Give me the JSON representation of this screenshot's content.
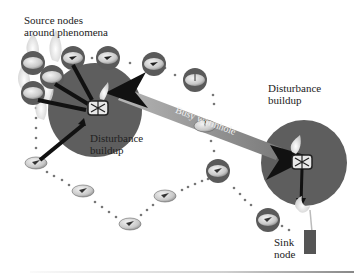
{
  "labels": {
    "source_nodes": "Source nodes\naround phenomena",
    "source_nodes_line1": "Source nodes",
    "source_nodes_line2": "around phenomena",
    "disturbance_left_line1": "Disturbance",
    "disturbance_left_line2": "buildup",
    "disturbance_right_line1": "Disturbance",
    "disturbance_right_line2": "buildup",
    "wormhole": "Busy wormhole",
    "sink_line1": "Sink",
    "sink_line2": "node"
  },
  "colors": {
    "disturbance_circle": "#5e5e5e",
    "node_ring": "#6a6a6a",
    "node_disc": "#d8d8d8",
    "wormhole_band": "#8a8a8a",
    "arrow": "#111111",
    "dots": "#777777",
    "sink": "#555555",
    "flame": "#e6e6e6"
  }
}
